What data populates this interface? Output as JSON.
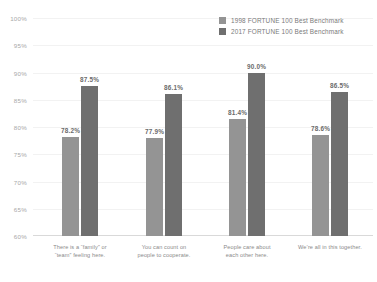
{
  "chart_data": {
    "type": "bar",
    "title": "",
    "xlabel": "",
    "ylabel": "",
    "ylim": [
      60,
      100
    ],
    "grid": true,
    "legend_position": "top-right",
    "y_ticks": [
      "100%",
      "95%",
      "90%",
      "85%",
      "80%",
      "75%",
      "70%",
      "65%",
      "60%"
    ],
    "y_tick_values": [
      100,
      95,
      90,
      85,
      80,
      75,
      70,
      65,
      60
    ],
    "categories": [
      "There is a “family” or\n“team” feeling here.",
      "You can count on\npeople to cooperate.",
      "People care about\neach other here.",
      "We’re all in this together."
    ],
    "series": [
      {
        "name": "1998 FORTUNE 100 Best Benchmark",
        "color": "#949494",
        "values": [
          78.2,
          77.9,
          81.4,
          78.6
        ],
        "labels": [
          "78.2%",
          "77.9%",
          "81.4%",
          "78.6%"
        ]
      },
      {
        "name": "2017 FORTUNE 100 Best Benchmark",
        "color": "#6f6f6f",
        "values": [
          87.5,
          86.1,
          90.0,
          86.5
        ],
        "labels": [
          "87.5%",
          "86.1%",
          "90.0%",
          "86.5%"
        ]
      }
    ]
  },
  "colors": {
    "series_1998": "#949494",
    "series_2017": "#6f6f6f",
    "gridline": "#f2f2f2",
    "baseline": "#d9d9d9",
    "tick_text": "#a8a8a8",
    "value_text": "#6b6b6b",
    "category_text": "#8a8a8a",
    "legend_text": "#7a7a7a",
    "background": "#ffffff"
  }
}
